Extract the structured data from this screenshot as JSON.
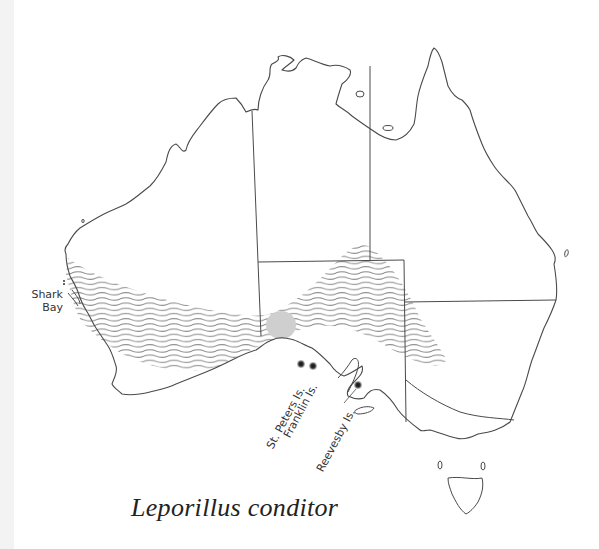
{
  "map": {
    "title": "Leporillus conditor",
    "region": "Australia",
    "labels": {
      "shark_bay_line1": "Shark",
      "shark_bay_line2": "Bay",
      "st_peters": "St. Peters Is.",
      "franklin": "Franklin Is.",
      "reevesby": "Reevesby Is."
    },
    "legend": {
      "historic_range": "wavy-hatched band",
      "current_population": "solid dot",
      "grey_blob": "light grey circular area"
    },
    "colors": {
      "outline": "#4a4a4a",
      "hatch": "#8f8f8f",
      "blob": "#cfcfcf",
      "dot": "#222222",
      "background": "#ffffff",
      "left_strip": "#f3f3f3"
    },
    "points": [
      {
        "name": "St. Peters Is.",
        "x": 301,
        "y": 364
      },
      {
        "name": "Franklin Is.",
        "x": 313,
        "y": 366
      },
      {
        "name": "Reevesby Is.",
        "x": 358,
        "y": 385
      }
    ]
  }
}
